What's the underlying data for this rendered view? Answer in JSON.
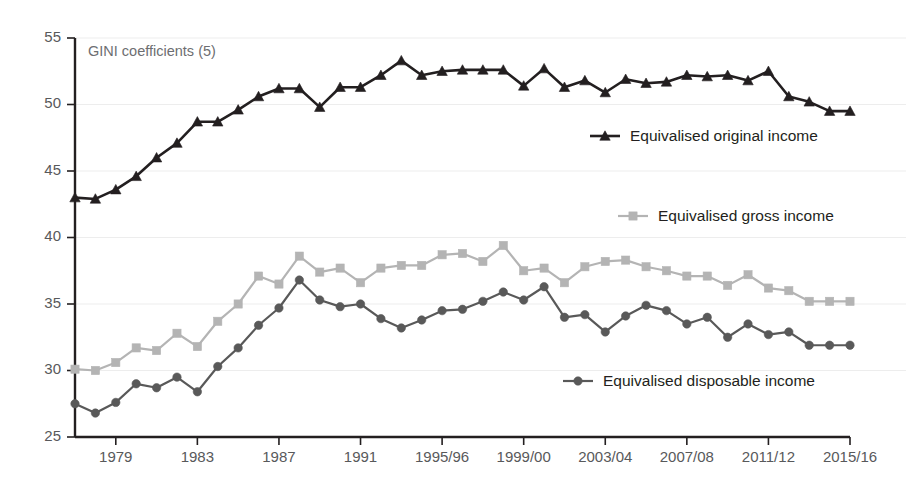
{
  "chart_data": {
    "type": "line",
    "title": "GINI coefficients (5)",
    "xlabel": "",
    "ylabel": "",
    "ylim": [
      25,
      55
    ],
    "y_ticks": [
      25,
      30,
      35,
      40,
      45,
      50,
      55
    ],
    "grid": true,
    "legend_position": "inside-right",
    "x": [
      "1977",
      "1978",
      "1979",
      "1980",
      "1981",
      "1982",
      "1983",
      "1984",
      "1985",
      "1986",
      "1987",
      "1988",
      "1989",
      "1990",
      "1991",
      "1992",
      "1993",
      "1994/95",
      "1995/96",
      "1996/97",
      "1997/98",
      "1998/99",
      "1999/00",
      "2000/01",
      "2001/02",
      "2002/03",
      "2003/04",
      "2004/05",
      "2005/06",
      "2006/07",
      "2007/08",
      "2008/09",
      "2009/10",
      "2010/11",
      "2011/12",
      "2012/13",
      "2013/14",
      "2014/15",
      "2015/16"
    ],
    "x_tick_labels": [
      "1979",
      "1983",
      "1987",
      "1991",
      "1995/96",
      "1999/00",
      "2003/04",
      "2007/08",
      "2011/12",
      "2015/16"
    ],
    "x_tick_indices": [
      2,
      6,
      10,
      14,
      18,
      22,
      26,
      30,
      34,
      38
    ],
    "series": [
      {
        "name": "Equivalised original income",
        "marker": "triangle",
        "color": "#231f20",
        "values": [
          43.0,
          42.9,
          43.6,
          44.6,
          46.0,
          47.1,
          48.7,
          48.7,
          49.6,
          50.6,
          51.2,
          51.2,
          49.8,
          51.3,
          51.3,
          52.2,
          53.3,
          52.2,
          52.5,
          52.6,
          52.6,
          52.6,
          51.4,
          52.7,
          51.3,
          51.8,
          50.9,
          51.9,
          51.6,
          51.7,
          52.2,
          52.1,
          52.2,
          51.8,
          52.5,
          50.6,
          50.2,
          49.5,
          49.5
        ]
      },
      {
        "name": "Equivalised gross income",
        "marker": "square",
        "color": "#b4b4b4",
        "values": [
          30.1,
          30.0,
          30.6,
          31.7,
          31.5,
          32.8,
          31.8,
          33.7,
          35.0,
          37.1,
          36.5,
          38.6,
          37.4,
          37.7,
          36.6,
          37.7,
          37.9,
          37.9,
          38.7,
          38.8,
          38.2,
          39.4,
          37.5,
          37.7,
          36.6,
          37.8,
          38.2,
          38.3,
          37.8,
          37.5,
          37.1,
          37.1,
          36.4,
          37.2,
          36.2,
          36.0,
          35.2,
          35.2,
          35.2
        ]
      },
      {
        "name": "Equivalised disposable income",
        "marker": "circle",
        "color": "#595959",
        "values": [
          27.5,
          26.8,
          27.6,
          29.0,
          28.7,
          29.5,
          28.4,
          30.3,
          31.7,
          33.4,
          34.7,
          36.8,
          35.3,
          34.8,
          35.0,
          33.9,
          33.2,
          33.8,
          34.5,
          34.6,
          35.2,
          35.9,
          35.3,
          36.3,
          34.0,
          34.2,
          32.9,
          34.1,
          34.9,
          34.5,
          33.5,
          34.0,
          32.5,
          33.5,
          32.7,
          32.9,
          31.9,
          31.9,
          31.9
        ]
      }
    ],
    "legend": [
      {
        "label": "Equivalised original income",
        "marker": "triangle",
        "color": "#231f20"
      },
      {
        "label": "Equivalised gross income",
        "marker": "square",
        "color": "#b4b4b4"
      },
      {
        "label": "Equivalised disposable income",
        "marker": "circle",
        "color": "#595959"
      }
    ]
  },
  "colors": {
    "background": "#ffffff",
    "axis": "#231f20",
    "grid": "#ededed",
    "tick_label": "#58595b",
    "title": "#6d6e71"
  }
}
